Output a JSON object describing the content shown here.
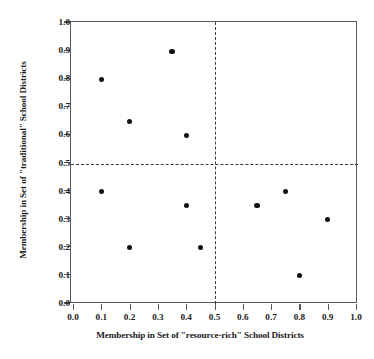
{
  "chart_data": {
    "type": "scatter",
    "title": "",
    "xlabel": "Membership in Set of \"resource-rich\" School Districts",
    "ylabel": "Membership in Set of \"traditional\" School Districts",
    "xlim": [
      0.0,
      1.0
    ],
    "ylim": [
      0.0,
      1.0
    ],
    "grid": false,
    "legend": null,
    "xticks": [
      "0.0",
      "0.1",
      "0.2",
      "0.3",
      "0.4",
      "0.5",
      "0.6",
      "0.7",
      "0.8",
      "0.9",
      "1.0"
    ],
    "yticks": [
      "0.0",
      "0.1",
      "0.2",
      "0.3",
      "0.4",
      "0.5",
      "0.6",
      "0.7",
      "0.8",
      "0.9",
      "1.0"
    ],
    "xtick_values": [
      0.0,
      0.1,
      0.2,
      0.3,
      0.4,
      0.5,
      0.6,
      0.7,
      0.8,
      0.9,
      1.0
    ],
    "ytick_values": [
      0.0,
      0.1,
      0.2,
      0.3,
      0.4,
      0.5,
      0.6,
      0.7,
      0.8,
      0.9,
      1.0
    ],
    "reference_lines": {
      "vertical_x": 0.5,
      "horizontal_y": 0.5,
      "style": "dashed",
      "color": "#3a3a3a"
    },
    "marker": {
      "shape": "circle",
      "color": "#111111",
      "size_px": 5.2
    },
    "points": [
      {
        "x": 0.1,
        "y": 0.8
      },
      {
        "x": 0.2,
        "y": 0.65
      },
      {
        "x": 0.35,
        "y": 0.9
      },
      {
        "x": 0.4,
        "y": 0.6
      },
      {
        "x": 0.1,
        "y": 0.4
      },
      {
        "x": 0.2,
        "y": 0.2
      },
      {
        "x": 0.4,
        "y": 0.35
      },
      {
        "x": 0.45,
        "y": 0.2
      },
      {
        "x": 0.65,
        "y": 0.35
      },
      {
        "x": 0.75,
        "y": 0.4
      },
      {
        "x": 0.8,
        "y": 0.1
      },
      {
        "x": 0.9,
        "y": 0.3
      }
    ],
    "x": [
      0.1,
      0.2,
      0.35,
      0.4,
      0.1,
      0.2,
      0.4,
      0.45,
      0.65,
      0.75,
      0.8,
      0.9
    ],
    "values": [
      0.8,
      0.65,
      0.9,
      0.6,
      0.4,
      0.2,
      0.35,
      0.2,
      0.35,
      0.4,
      0.1,
      0.3
    ]
  }
}
